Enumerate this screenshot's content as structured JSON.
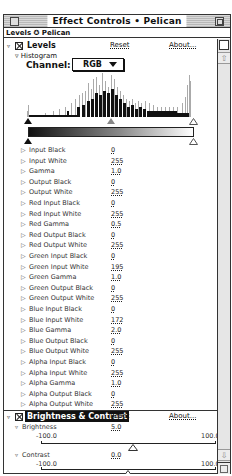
{
  "window": {
    "title": "Effect Controls • Pelican",
    "subtitle": "Levels ✪ Pelican"
  },
  "levels": {
    "name": "Levels",
    "reset_label": "Reset",
    "about_label": "About...",
    "histogram_label": "Histogram",
    "channel_label": "Channel:",
    "channel_value": "RGB",
    "params": [
      {
        "label": "Input Black",
        "value": "0"
      },
      {
        "label": "Input White",
        "value": "255"
      },
      {
        "label": "Gamma",
        "value": "1.0"
      },
      {
        "label": "Output Black",
        "value": "0"
      },
      {
        "label": "Output White",
        "value": "255"
      },
      {
        "label": "Red Input Black",
        "value": "0"
      },
      {
        "label": "Red Input White",
        "value": "255"
      },
      {
        "label": "Red Gamma",
        "value": "0.5"
      },
      {
        "label": "Red Output Black",
        "value": "0"
      },
      {
        "label": "Red Output White",
        "value": "255"
      },
      {
        "label": "Green Input Black",
        "value": "0"
      },
      {
        "label": "Green Input White",
        "value": "195"
      },
      {
        "label": "Green Gamma",
        "value": "1.0"
      },
      {
        "label": "Green Output Black",
        "value": "0"
      },
      {
        "label": "Green Output White",
        "value": "255"
      },
      {
        "label": "Blue Input Black",
        "value": "0"
      },
      {
        "label": "Blue Input White",
        "value": "172"
      },
      {
        "label": "Blue Gamma",
        "value": "2.0"
      },
      {
        "label": "Blue Output Black",
        "value": "0"
      },
      {
        "label": "Blue Output White",
        "value": "255"
      },
      {
        "label": "Alpha Input Black",
        "value": "0"
      },
      {
        "label": "Alpha Input White",
        "value": "255"
      },
      {
        "label": "Alpha Gamma",
        "value": "1.0"
      },
      {
        "label": "Alpha Output Black",
        "value": "0"
      },
      {
        "label": "Alpha Output White",
        "value": "255"
      }
    ]
  },
  "brightness_contrast": {
    "name": "Brightness & Contrast",
    "reset_label": "Reset",
    "about_label": "About...",
    "brightness": {
      "label": "Brightness",
      "value": "5.0",
      "min": "-100.0",
      "max": "100.0",
      "position": 0.525
    },
    "contrast": {
      "label": "Contrast",
      "value": "0.0",
      "min": "-100.0",
      "max": "100.0",
      "position": 0.5
    }
  },
  "icons": {
    "disclosure_open": "▿",
    "disclosure_closed": "▷",
    "scroll_up": "⇧",
    "scroll_down": "⇩"
  },
  "colors": {
    "frame": "#333333",
    "titlebar_stripe": "#b8b8b8",
    "histogram_dark": "#111111",
    "histogram_light": "#aaaaaa"
  }
}
